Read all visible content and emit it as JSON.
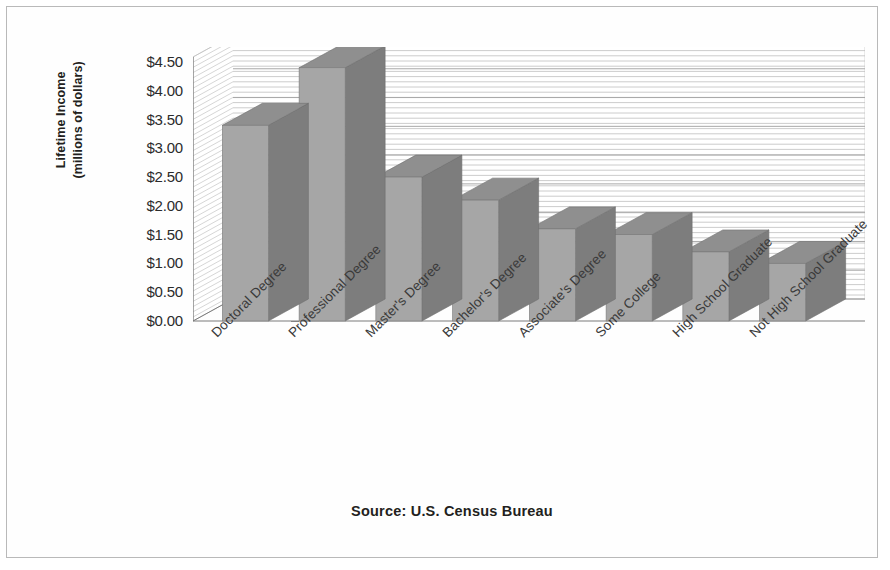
{
  "figure": {
    "source_note": "Source: U.S. Census Bureau",
    "y_axis_title_line1": "Lifetime Income",
    "y_axis_title_line2": "(millions of dollars)"
  },
  "chart_data": {
    "type": "bar",
    "title": "",
    "subtitle": "",
    "xlabel": "",
    "ylabel": "Lifetime Income (millions of dollars)",
    "categories": [
      "Doctoral Degree",
      "Professional Degree",
      "Master's Degree",
      "Bachelor's Degree",
      "Associate's Degree",
      "Some College",
      "High School Graduate",
      "Not High School Graduate"
    ],
    "values": [
      3.4,
      4.4,
      2.5,
      2.1,
      1.6,
      1.5,
      1.2,
      1.0
    ],
    "ylim": [
      0,
      4.5
    ],
    "ytick_values": [
      0,
      0.5,
      1.0,
      1.5,
      2.0,
      2.5,
      3.0,
      3.5,
      4.0,
      4.5
    ],
    "ytick_labels": [
      "$0.00",
      "$0.50",
      "$1.00",
      "$1.50",
      "$2.00",
      "$2.50",
      "$3.00",
      "$3.50",
      "$4.00",
      "$4.50"
    ],
    "grid": true,
    "grid_orientation": "horizontal",
    "legend": "none",
    "style": "3d-column",
    "annotations": [
      "Source: U.S. Census Bureau"
    ],
    "colors": {
      "bar_front": "#a6a6a6",
      "bar_top": "#8f8f8f",
      "bar_side": "#7d7d7d",
      "grid_line": "#bcbcbc",
      "axis_line": "#7a7a7a",
      "text": "#2b2b2b",
      "frame_border": "#b9b9b9",
      "background": "#ffffff"
    }
  }
}
